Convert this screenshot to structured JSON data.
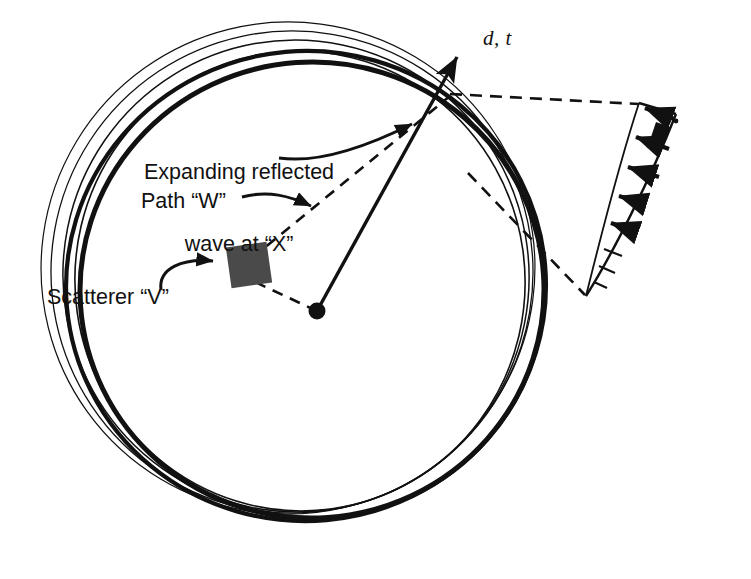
{
  "figure": {
    "background_color": "#ffffff",
    "ink_color": "#111111",
    "scatterer_fill": "#4a4a4a"
  },
  "labels": {
    "wave_line1": "Expanding reflected",
    "wave_line2": "wave at “X”",
    "path": "Path “W”",
    "scatterer": "Scatterer “V”",
    "axis_arrow": "d, t",
    "profile_symbol": "σ"
  },
  "chart_data": {
    "type": "diagram",
    "elements": {
      "source_point": {
        "x": 317,
        "y": 311,
        "radius": 8,
        "label": "source"
      },
      "scatterer_square": {
        "cx": 249,
        "cy": 265,
        "size": 41,
        "rotation_deg": -8,
        "label": "Scatterer “V”"
      },
      "reflection_point_X": {
        "x": 450,
        "y": 96,
        "label": "X"
      },
      "axis_arrow": {
        "from": [
          317,
          311
        ],
        "to": [
          457,
          55
        ],
        "label": "d, t",
        "style": "solid"
      },
      "path_W": {
        "from": [
          317,
          311
        ],
        "via": [
          249,
          265
        ],
        "to": [
          450,
          96
        ],
        "style": "dashed",
        "label": "Path “W”"
      }
    },
    "wavefronts": [
      {
        "cx": 312,
        "cy": 290,
        "rx": 232,
        "ry": 228,
        "stroke_width": 5.0,
        "rotation_deg": -4
      },
      {
        "cx": 306,
        "cy": 286,
        "rx": 240,
        "ry": 235,
        "stroke_width": 4.2,
        "rotation_deg": -5
      },
      {
        "cx": 300,
        "cy": 281,
        "rx": 225,
        "ry": 230,
        "stroke_width": 1.6,
        "rotation_deg": -8
      },
      {
        "cx": 296,
        "cy": 276,
        "rx": 233,
        "ry": 236,
        "stroke_width": 1.5,
        "rotation_deg": -10
      },
      {
        "cx": 292,
        "cy": 272,
        "rx": 241,
        "ry": 241,
        "stroke_width": 1.3,
        "rotation_deg": -12
      },
      {
        "cx": 288,
        "cy": 268,
        "rx": 247,
        "ry": 246,
        "stroke_width": 1.2,
        "rotation_deg": -14
      }
    ],
    "profile_fan": {
      "apex": [
        586,
        296
      ],
      "top_left": [
        639,
        103
      ],
      "top_right": [
        676,
        113
      ],
      "description": "tapering amplitude profile with arrows",
      "arrow_count": 5,
      "arrows": [
        {
          "from": [
            672,
            118
          ],
          "to": [
            640,
            107
          ],
          "filled": true
        },
        {
          "from": [
            668,
            148
          ],
          "to": [
            632,
            136
          ],
          "filled": true
        },
        {
          "from": [
            659,
            176
          ],
          "to": [
            624,
            166
          ],
          "filled": true
        },
        {
          "from": [
            643,
            203
          ],
          "to": [
            615,
            195
          ],
          "filled": true
        },
        {
          "from": [
            630,
            229
          ],
          "to": [
            607,
            222
          ],
          "filled": true
        }
      ],
      "rungs": [
        {
          "from": [
            602,
            248
          ],
          "to": [
            622,
            255
          ]
        },
        {
          "from": [
            598,
            266
          ],
          "to": [
            614,
            272
          ]
        },
        {
          "from": [
            593,
            282
          ],
          "to": [
            606,
            287
          ]
        }
      ]
    },
    "connector_lines": [
      {
        "from": [
          450,
          96
        ],
        "to": [
          639,
          103
        ],
        "style": "dashed",
        "name": "upper-tie"
      },
      {
        "from": [
          468,
          173
        ],
        "to": [
          586,
          296
        ],
        "style": "dashed",
        "name": "lower-tie"
      }
    ],
    "annotation_leaders": [
      {
        "name": "wave-leader",
        "from": [
          330,
          145
        ],
        "to": [
          425,
          115
        ]
      },
      {
        "name": "path-leader",
        "from": [
          258,
          200
        ],
        "to": [
          320,
          205
        ]
      },
      {
        "name": "scatterer-leader",
        "from": [
          170,
          285
        ],
        "to": [
          226,
          262
        ]
      }
    ]
  }
}
